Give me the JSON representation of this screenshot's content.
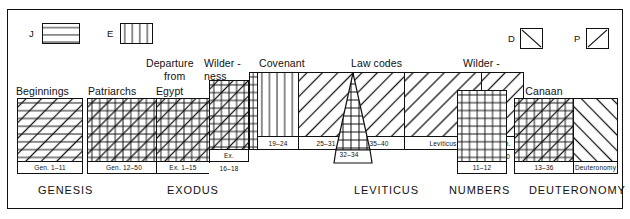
{
  "legend": {
    "items": [
      {
        "key": "J",
        "label": "J",
        "pattern": "horizontal",
        "name": "legend-swatch-j"
      },
      {
        "key": "E",
        "label": "E",
        "pattern": "vertical",
        "name": "legend-swatch-e"
      },
      {
        "key": "D",
        "label": "D",
        "pattern": "backslash",
        "name": "legend-swatch-d"
      },
      {
        "key": "P",
        "label": "P",
        "pattern": "forwardslash",
        "name": "legend-swatch-p"
      }
    ]
  },
  "section_titles": [
    {
      "id": "beginnings",
      "text": "Beginnings"
    },
    {
      "id": "patriarchs",
      "text": "Patriarchs"
    },
    {
      "id": "departure",
      "text": "Departure"
    },
    {
      "id": "departure2",
      "text": "from"
    },
    {
      "id": "departure3",
      "text": "Egypt"
    },
    {
      "id": "wilderness1",
      "text": "Wilder -"
    },
    {
      "id": "wilderness1b",
      "text": "ness"
    },
    {
      "id": "covenant",
      "text": "Covenant"
    },
    {
      "id": "lawcodes",
      "text": "Law codes"
    },
    {
      "id": "wilderness2",
      "text": "Wilder -"
    },
    {
      "id": "wilderness2b",
      "text": "ness"
    },
    {
      "id": "tocanaan",
      "text": "To Canaan"
    }
  ],
  "blocks": [
    {
      "id": "beginnings",
      "caption": "Gen. 1–11",
      "sources": [
        "J",
        "P"
      ]
    },
    {
      "id": "patriarchs",
      "caption": "Gen. 12–50",
      "sources": [
        "J",
        "E",
        "P"
      ]
    },
    {
      "id": "egypt",
      "caption": "Ex. 1–15",
      "sources": [
        "J",
        "E",
        "P"
      ]
    },
    {
      "id": "wilderness1",
      "caption": "Ex.",
      "caption2": "16–18",
      "sources": [
        "J",
        "E",
        "P"
      ]
    },
    {
      "id": "sinai-strip",
      "caption": "",
      "sources": [
        "J",
        "E"
      ]
    },
    {
      "id": "cov-1924",
      "caption": "19–24",
      "sources": [
        "E"
      ]
    },
    {
      "id": "cov-2531",
      "caption": "25–31",
      "sources": [
        "P"
      ]
    },
    {
      "id": "cov-3234",
      "caption": "32–34",
      "sources": [
        "J",
        "E"
      ]
    },
    {
      "id": "law-3540",
      "caption": "35–40",
      "sources": [
        "P"
      ]
    },
    {
      "id": "law-lev",
      "caption": "Leviticus",
      "sources": [
        "P"
      ]
    },
    {
      "id": "law-num",
      "caption": "Num.",
      "caption2": "1–10",
      "sources": [
        "P"
      ]
    },
    {
      "id": "wilderness2",
      "caption": "11–12",
      "sources": [
        "J",
        "E"
      ]
    },
    {
      "id": "canaan",
      "caption": "13–36",
      "sources": [
        "J",
        "E",
        "P"
      ]
    },
    {
      "id": "deuteronomy",
      "caption": "Deuteronomy",
      "sources": [
        "D"
      ]
    }
  ],
  "book_labels": [
    {
      "id": "genesis",
      "text": "GENESIS"
    },
    {
      "id": "exodus",
      "text": "EXODUS"
    },
    {
      "id": "leviticus",
      "text": "LEVITICUS"
    },
    {
      "id": "numbers",
      "text": "NUMBERS"
    },
    {
      "id": "deuteronomy",
      "text": "DEUTERONOMY"
    }
  ],
  "colors": {
    "ink": "#111111",
    "paper": "#ffffff"
  }
}
